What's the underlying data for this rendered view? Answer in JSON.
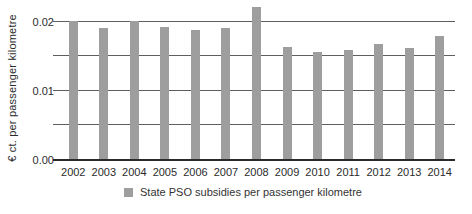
{
  "chart_data": {
    "type": "bar",
    "title": "",
    "categories": [
      "2002",
      "2003",
      "2004",
      "2005",
      "2006",
      "2007",
      "2008",
      "2009",
      "2010",
      "2011",
      "2012",
      "2013",
      "2014"
    ],
    "values": [
      0.02,
      0.0189,
      0.02,
      0.019,
      0.0186,
      0.0189,
      0.022,
      0.0162,
      0.0154,
      0.0157,
      0.0166,
      0.0161,
      0.0177
    ],
    "series_name": "State PSO subsidies per passenger kilometre",
    "xlabel": "",
    "ylabel": "€ ct. per passenger kilometre",
    "ylim": [
      0,
      0.022
    ],
    "yticks": [
      {
        "label": "0.02",
        "value": 0.02
      },
      {
        "label": "0.01",
        "value": 0.01
      },
      {
        "label": "0.00",
        "value": 0.0
      }
    ],
    "gridline_values": [
      0.005,
      0.01,
      0.015,
      0.02
    ],
    "grid": true,
    "legend_position": "bottom",
    "colors": {
      "bar": "#9e9e9e",
      "gridline": "#5f5f5f",
      "axis": "#2a2a2a",
      "text": "#2b2b2b"
    }
  },
  "legend": {
    "label": "State PSO subsidies per passenger kilometre",
    "swatch_color": "#9e9e9e"
  }
}
